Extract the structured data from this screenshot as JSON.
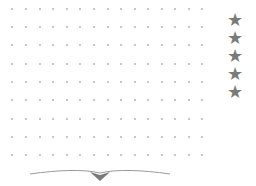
{
  "board": {
    "columns_x": [
      12,
      26,
      40,
      53,
      67,
      80,
      94,
      108,
      121,
      135,
      148,
      162,
      175,
      189,
      202
    ],
    "rows_y": [
      9,
      27,
      45,
      64,
      82,
      100,
      119,
      137,
      155
    ],
    "dot_color": "#b4b4b4"
  },
  "lives": {
    "count": 5,
    "icon": "star-icon",
    "glyph": "★",
    "color": "#7a7a7a",
    "positions_y": [
      6,
      24,
      42,
      60,
      78
    ]
  },
  "flourish": {
    "icon": "decorative-flourish-icon",
    "color": "#8a8a8a"
  }
}
